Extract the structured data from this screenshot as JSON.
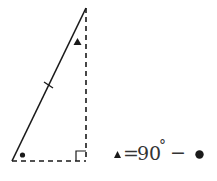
{
  "diagram": {
    "type": "right-triangle",
    "vertices": {
      "top": [
        86,
        8
      ],
      "bottom_left": [
        12,
        161
      ],
      "bottom_right": [
        86,
        161
      ]
    },
    "sides": {
      "hypotenuse": {
        "style": "solid",
        "tick_marks": 1
      },
      "vertical_leg": {
        "style": "dashed"
      },
      "horizontal_leg": {
        "style": "dashed"
      }
    },
    "angle_markers": {
      "top_angle": "triangle-marker",
      "bottom_left_angle": "dot-marker",
      "bottom_right_angle": "right-angle-square"
    },
    "colors": {
      "line": "#1a1a1a",
      "text": "#333333"
    }
  },
  "equation": {
    "lhs_symbol": "▲",
    "equals": "=",
    "value": "90",
    "degree": "°",
    "minus": "−",
    "rhs_symbol": "●"
  }
}
